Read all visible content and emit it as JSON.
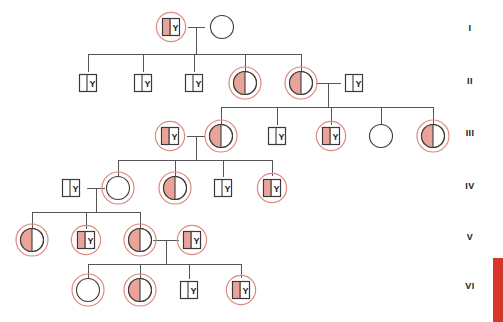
{
  "figure": {
    "type": "pedigree-chart",
    "width": 503,
    "height": 322,
    "background": "#ffffff"
  },
  "colors": {
    "affected_fill": "#e9a399",
    "unaffected_fill": "#ffffff",
    "symbol_stroke": "#3a3a3a",
    "line_stroke": "#555555",
    "carrier_ring": "#e0877f",
    "edge_bar": "#d8352a",
    "text": "#1a1a1a"
  },
  "generation_labels": [
    {
      "text": "I",
      "x": 470,
      "y": 31
    },
    {
      "text": "II",
      "x": 470,
      "y": 84
    },
    {
      "text": "III",
      "x": 470,
      "y": 136
    },
    {
      "text": "IV",
      "x": 470,
      "y": 189
    },
    {
      "text": "V",
      "x": 470,
      "y": 240
    },
    {
      "text": "VI",
      "x": 470,
      "y": 289
    }
  ],
  "symbol_marks": {
    "y_chromosome_label": "Y"
  },
  "individuals": [
    {
      "id": "I-1",
      "generation": "I",
      "shape": "square",
      "fill": "half",
      "ring": true,
      "y_label": "Y",
      "x": 171,
      "y": 27
    },
    {
      "id": "I-2",
      "generation": "I",
      "shape": "circle",
      "fill": "none",
      "ring": false,
      "y_label": "",
      "x": 222,
      "y": 27
    },
    {
      "id": "II-1",
      "generation": "II",
      "shape": "square",
      "fill": "none",
      "ring": false,
      "y_label": "Y",
      "x": 88,
      "y": 83
    },
    {
      "id": "II-2",
      "generation": "II",
      "shape": "square",
      "fill": "none",
      "ring": false,
      "y_label": "Y",
      "x": 143,
      "y": 83
    },
    {
      "id": "II-3",
      "generation": "II",
      "shape": "square",
      "fill": "none",
      "ring": false,
      "y_label": "Y",
      "x": 194,
      "y": 83
    },
    {
      "id": "II-4",
      "generation": "II",
      "shape": "circle",
      "fill": "half",
      "ring": true,
      "y_label": "",
      "x": 245,
      "y": 83
    },
    {
      "id": "II-5",
      "generation": "II",
      "shape": "circle",
      "fill": "half",
      "ring": true,
      "y_label": "",
      "x": 301,
      "y": 83
    },
    {
      "id": "II-6",
      "generation": "II",
      "shape": "square",
      "fill": "none",
      "ring": false,
      "y_label": "Y",
      "x": 354,
      "y": 83
    },
    {
      "id": "III-1",
      "generation": "III",
      "shape": "square",
      "fill": "half",
      "ring": true,
      "y_label": "Y",
      "x": 170,
      "y": 136
    },
    {
      "id": "III-2",
      "generation": "III",
      "shape": "circle",
      "fill": "half",
      "ring": true,
      "y_label": "",
      "x": 221,
      "y": 136
    },
    {
      "id": "III-3",
      "generation": "III",
      "shape": "square",
      "fill": "none",
      "ring": false,
      "y_label": "Y",
      "x": 277,
      "y": 136
    },
    {
      "id": "III-4",
      "generation": "III",
      "shape": "square",
      "fill": "half",
      "ring": true,
      "y_label": "Y",
      "x": 331,
      "y": 136
    },
    {
      "id": "III-5",
      "generation": "III",
      "shape": "circle",
      "fill": "none",
      "ring": false,
      "y_label": "",
      "x": 381,
      "y": 136
    },
    {
      "id": "III-6",
      "generation": "III",
      "shape": "circle",
      "fill": "half",
      "ring": true,
      "y_label": "",
      "x": 433,
      "y": 136
    },
    {
      "id": "IV-1",
      "generation": "IV",
      "shape": "square",
      "fill": "none",
      "ring": false,
      "y_label": "Y",
      "x": 71,
      "y": 188
    },
    {
      "id": "IV-2",
      "generation": "IV",
      "shape": "circle",
      "fill": "full",
      "ring": true,
      "y_label": "",
      "x": 118,
      "y": 188
    },
    {
      "id": "IV-3",
      "generation": "IV",
      "shape": "circle",
      "fill": "half",
      "ring": true,
      "y_label": "",
      "x": 175,
      "y": 188
    },
    {
      "id": "IV-4",
      "generation": "IV",
      "shape": "square",
      "fill": "none",
      "ring": false,
      "y_label": "Y",
      "x": 223,
      "y": 188
    },
    {
      "id": "IV-5",
      "generation": "IV",
      "shape": "square",
      "fill": "half",
      "ring": true,
      "y_label": "Y",
      "x": 272,
      "y": 188
    },
    {
      "id": "V-1",
      "generation": "V",
      "shape": "circle",
      "fill": "half",
      "ring": true,
      "y_label": "",
      "x": 32,
      "y": 240
    },
    {
      "id": "V-2",
      "generation": "V",
      "shape": "square",
      "fill": "half",
      "ring": true,
      "y_label": "Y",
      "x": 86,
      "y": 240
    },
    {
      "id": "V-3",
      "generation": "V",
      "shape": "circle",
      "fill": "half",
      "ring": true,
      "y_label": "",
      "x": 140,
      "y": 240
    },
    {
      "id": "V-4",
      "generation": "V",
      "shape": "square",
      "fill": "half",
      "ring": true,
      "y_label": "Y",
      "x": 192,
      "y": 240
    },
    {
      "id": "VI-1",
      "generation": "VI",
      "shape": "circle",
      "fill": "full",
      "ring": true,
      "y_label": "",
      "x": 88,
      "y": 290
    },
    {
      "id": "VI-2",
      "generation": "VI",
      "shape": "circle",
      "fill": "half",
      "ring": true,
      "y_label": "",
      "x": 140,
      "y": 290
    },
    {
      "id": "VI-3",
      "generation": "VI",
      "shape": "square",
      "fill": "none",
      "ring": false,
      "y_label": "Y",
      "x": 189,
      "y": 290
    },
    {
      "id": "VI-4",
      "generation": "VI",
      "shape": "square",
      "fill": "half",
      "ring": true,
      "y_label": "Y",
      "x": 241,
      "y": 290
    }
  ],
  "connectors": [
    {
      "name": "mating-I",
      "points": "188,27 205,27"
    },
    {
      "name": "descent-I",
      "points": "196,27 196,54"
    },
    {
      "name": "sibship-I",
      "points": "88,54 301,54"
    },
    {
      "name": "drop-II-1",
      "points": "88,54 88,72"
    },
    {
      "name": "drop-II-2",
      "points": "143,54 143,72"
    },
    {
      "name": "drop-II-3",
      "points": "194,54 194,72"
    },
    {
      "name": "drop-II-4",
      "points": "245,54 245,72"
    },
    {
      "name": "drop-II-5",
      "points": "301,54 301,72"
    },
    {
      "name": "mating-II",
      "points": "316,83 341,83"
    },
    {
      "name": "descent-II",
      "points": "328,83 328,107"
    },
    {
      "name": "sibship-II",
      "points": "221,107 433,107"
    },
    {
      "name": "drop-III-2",
      "points": "221,107 221,124"
    },
    {
      "name": "drop-III-3",
      "points": "277,107 277,125"
    },
    {
      "name": "drop-III-4",
      "points": "331,107 331,125"
    },
    {
      "name": "drop-III-5",
      "points": "381,107 381,124"
    },
    {
      "name": "drop-III-6",
      "points": "433,107 433,124"
    },
    {
      "name": "mating-III",
      "points": "187,136 205,136"
    },
    {
      "name": "descent-III",
      "points": "196,136 196,160"
    },
    {
      "name": "sibship-III",
      "points": "118,160 272,160"
    },
    {
      "name": "drop-IV-2",
      "points": "118,160 118,176"
    },
    {
      "name": "drop-IV-3",
      "points": "175,160 175,176"
    },
    {
      "name": "drop-IV-4",
      "points": "223,160 223,177"
    },
    {
      "name": "drop-IV-5",
      "points": "272,160 272,176"
    },
    {
      "name": "mating-IV",
      "points": "87,188 105,188"
    },
    {
      "name": "descent-IV",
      "points": "96,188 96,212"
    },
    {
      "name": "sibship-IV",
      "points": "32,212 140,212"
    },
    {
      "name": "drop-V-1",
      "points": "32,212 32,228"
    },
    {
      "name": "drop-V-2",
      "points": "86,212 86,229"
    },
    {
      "name": "drop-V-3",
      "points": "140,212 140,228"
    },
    {
      "name": "mating-V",
      "points": "153,240 179,240"
    },
    {
      "name": "descent-V",
      "points": "166,240 166,264"
    },
    {
      "name": "sibship-V",
      "points": "88,264 241,264"
    },
    {
      "name": "drop-VI-1",
      "points": "88,264 88,278"
    },
    {
      "name": "drop-VI-2",
      "points": "140,264 140,278"
    },
    {
      "name": "drop-VI-3",
      "points": "189,264 189,279"
    },
    {
      "name": "drop-VI-4",
      "points": "241,264 241,278"
    }
  ],
  "edge_bar": {
    "name": "page-edge-bar",
    "top": 258,
    "height": 64
  }
}
